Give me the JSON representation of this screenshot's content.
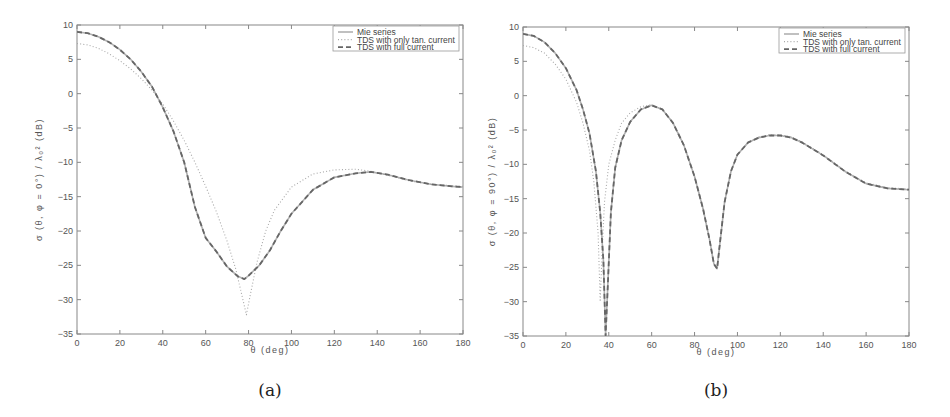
{
  "chart_data": [
    {
      "id": "a",
      "type": "line",
      "caption": "(a)",
      "xlabel": "θ (deg)",
      "ylabel": "σ (θ, φ = 0°) / λ₀² (dB)",
      "xlim": [
        0,
        180
      ],
      "ylim": [
        -35,
        10
      ],
      "xticks": [
        0,
        20,
        40,
        60,
        80,
        100,
        120,
        140,
        160,
        180
      ],
      "yticks": [
        10,
        5,
        0,
        -5,
        -10,
        -15,
        -20,
        -25,
        -30,
        -35
      ],
      "grid": false,
      "legend_position": "upper right",
      "legend": [
        "Mie series",
        "TDS with only tan. current",
        "TDS with full current"
      ],
      "series": [
        {
          "name": "Mie series",
          "style": "solid",
          "color": "#b0b0b0",
          "x": [
            0,
            5,
            10,
            15,
            20,
            25,
            30,
            35,
            40,
            45,
            50,
            55,
            60,
            65,
            70,
            75,
            78,
            80,
            85,
            90,
            95,
            100,
            110,
            120,
            130,
            137,
            145,
            155,
            165,
            175,
            180
          ],
          "y": [
            9,
            8.8,
            8.3,
            7.5,
            6.4,
            5.0,
            3.2,
            1.0,
            -2.0,
            -5.5,
            -10.0,
            -16.5,
            -21.0,
            -23.0,
            -25.2,
            -26.6,
            -27.0,
            -26.5,
            -25.0,
            -22.8,
            -20.0,
            -17.5,
            -14.0,
            -12.2,
            -11.6,
            -11.4,
            -11.8,
            -12.6,
            -13.2,
            -13.5,
            -13.6
          ]
        },
        {
          "name": "TDS with only tan. current",
          "style": "dotted",
          "color": "#a8a8a8",
          "x": [
            0,
            5,
            10,
            15,
            20,
            25,
            30,
            35,
            40,
            45,
            50,
            55,
            60,
            65,
            70,
            74,
            77,
            79,
            81,
            84,
            88,
            92,
            100,
            110,
            120,
            130,
            137,
            145,
            155,
            165,
            175,
            180
          ],
          "y": [
            7.3,
            7.1,
            6.6,
            5.8,
            4.8,
            3.6,
            2.2,
            0.5,
            -1.5,
            -4.0,
            -6.8,
            -10.0,
            -13.5,
            -17.2,
            -21.5,
            -25.5,
            -29.5,
            -32.2,
            -29.0,
            -24.5,
            -20.0,
            -17.0,
            -13.6,
            -11.7,
            -11.1,
            -11.0,
            -11.3,
            -11.9,
            -12.7,
            -13.2,
            -13.4,
            -13.5
          ]
        },
        {
          "name": "TDS with full current",
          "style": "dashed",
          "color": "#666666",
          "x": [
            0,
            5,
            10,
            15,
            20,
            25,
            30,
            35,
            40,
            45,
            50,
            55,
            60,
            65,
            70,
            75,
            78,
            80,
            85,
            90,
            95,
            100,
            110,
            120,
            130,
            137,
            145,
            155,
            165,
            175,
            180
          ],
          "y": [
            9,
            8.8,
            8.3,
            7.5,
            6.4,
            5.0,
            3.2,
            1.0,
            -2.0,
            -5.5,
            -10.0,
            -16.5,
            -21.0,
            -23.0,
            -25.2,
            -26.6,
            -27.0,
            -26.5,
            -25.0,
            -22.8,
            -20.0,
            -17.5,
            -14.0,
            -12.2,
            -11.6,
            -11.4,
            -11.8,
            -12.6,
            -13.2,
            -13.5,
            -13.6
          ]
        }
      ]
    },
    {
      "id": "b",
      "type": "line",
      "caption": "(b)",
      "xlabel": "θ (deg)",
      "ylabel": "σ (θ, φ = 90°) / λ₀² (dB)",
      "xlim": [
        0,
        180
      ],
      "ylim": [
        -35,
        10
      ],
      "xticks": [
        0,
        20,
        40,
        60,
        80,
        100,
        120,
        140,
        160,
        180
      ],
      "yticks": [
        10,
        5,
        0,
        -5,
        -10,
        -15,
        -20,
        -25,
        -30,
        -35
      ],
      "grid": false,
      "legend_position": "upper right",
      "legend": [
        "Mie series",
        "TDS with only tan. current",
        "TDS with full current"
      ],
      "series": [
        {
          "name": "Mie series",
          "style": "solid",
          "color": "#b0b0b0",
          "x": [
            0,
            5,
            10,
            15,
            20,
            25,
            28,
            31,
            34,
            36,
            37.5,
            38.5,
            39.5,
            41,
            43,
            46,
            50,
            55,
            60,
            65,
            70,
            75,
            80,
            84,
            87,
            89,
            90.5,
            92,
            94,
            97,
            100,
            105,
            110,
            115,
            120,
            125,
            130,
            140,
            150,
            160,
            170,
            180
          ],
          "y": [
            9,
            8.7,
            7.8,
            6.2,
            4.0,
            0.8,
            -2.0,
            -5.5,
            -11.0,
            -17.0,
            -24.0,
            -35,
            -28.0,
            -17.0,
            -10.5,
            -6.5,
            -3.8,
            -2.0,
            -1.4,
            -2.0,
            -4.0,
            -7.2,
            -11.8,
            -16.5,
            -21.0,
            -24.5,
            -25.2,
            -21.0,
            -15.5,
            -11.0,
            -8.6,
            -6.8,
            -6.1,
            -5.8,
            -5.8,
            -6.1,
            -6.8,
            -8.7,
            -11.0,
            -12.8,
            -13.5,
            -13.7
          ]
        },
        {
          "name": "TDS with only tan. current",
          "style": "dotted",
          "color": "#a8a8a8",
          "x": [
            0,
            5,
            10,
            15,
            20,
            25,
            28,
            31,
            33,
            35,
            36,
            37,
            38,
            40,
            43,
            46,
            50,
            55,
            60,
            65,
            70,
            75,
            80,
            84,
            87,
            89,
            90.5,
            92,
            94,
            97,
            100,
            105,
            110,
            115,
            120,
            125,
            130,
            140,
            150,
            160,
            170,
            180
          ],
          "y": [
            7.3,
            7.0,
            6.2,
            4.6,
            2.4,
            -1.0,
            -4.0,
            -8.0,
            -12.5,
            -20.0,
            -30.0,
            -22.0,
            -15.5,
            -10.0,
            -6.5,
            -4.0,
            -2.5,
            -1.6,
            -1.3,
            -2.0,
            -4.0,
            -7.2,
            -11.8,
            -16.5,
            -21.0,
            -24.5,
            -25.0,
            -21.0,
            -15.5,
            -11.0,
            -8.6,
            -6.8,
            -6.0,
            -5.7,
            -5.7,
            -6.0,
            -6.7,
            -8.6,
            -10.9,
            -12.7,
            -13.4,
            -13.6
          ]
        },
        {
          "name": "TDS with full current",
          "style": "dashed",
          "color": "#666666",
          "x": [
            0,
            5,
            10,
            15,
            20,
            25,
            28,
            31,
            34,
            36,
            37.5,
            38.5,
            39.5,
            41,
            43,
            46,
            50,
            55,
            60,
            65,
            70,
            75,
            80,
            84,
            87,
            89,
            90.5,
            92,
            94,
            97,
            100,
            105,
            110,
            115,
            120,
            125,
            130,
            140,
            150,
            160,
            170,
            180
          ],
          "y": [
            9,
            8.7,
            7.8,
            6.2,
            4.0,
            0.8,
            -2.0,
            -5.5,
            -11.0,
            -17.0,
            -24.0,
            -35,
            -28.0,
            -17.0,
            -10.5,
            -6.5,
            -3.8,
            -2.0,
            -1.4,
            -2.0,
            -4.0,
            -7.2,
            -11.8,
            -16.5,
            -21.0,
            -24.5,
            -25.2,
            -21.0,
            -15.5,
            -11.0,
            -8.6,
            -6.8,
            -6.1,
            -5.8,
            -5.8,
            -6.1,
            -6.8,
            -8.7,
            -11.0,
            -12.8,
            -13.5,
            -13.7
          ]
        }
      ]
    }
  ]
}
